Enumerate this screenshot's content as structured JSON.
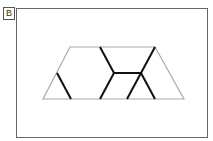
{
  "figure": {
    "label": "B",
    "outline_color": "#aaaaaa",
    "line_color": "#111111",
    "trapezoid": {
      "top": [
        [
          70,
          47
        ],
        [
          155,
          47
        ]
      ],
      "bottom": [
        [
          43,
          99
        ],
        [
          184,
          99
        ]
      ]
    },
    "segments": [
      [
        [
          57,
          73
        ],
        [
          71,
          99
        ]
      ],
      [
        [
          100,
          47
        ],
        [
          114,
          73
        ]
      ],
      [
        [
          114,
          73
        ],
        [
          100,
          99
        ]
      ],
      [
        [
          114,
          73
        ],
        [
          141,
          73
        ]
      ],
      [
        [
          155,
          47
        ],
        [
          141,
          73
        ]
      ],
      [
        [
          141,
          73
        ],
        [
          127,
          99
        ]
      ],
      [
        [
          141,
          73
        ],
        [
          155,
          99
        ]
      ]
    ]
  }
}
